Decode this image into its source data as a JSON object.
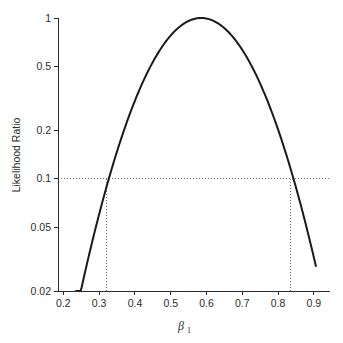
{
  "chart_data": {
    "type": "line",
    "title": "",
    "xlabel": "β₁",
    "ylabel": "Likelihood Ratio",
    "xlabel_base": "β",
    "xlabel_sub": "1",
    "yscale": "log",
    "xscale": "linear",
    "xlim": [
      0.185,
      0.945
    ],
    "ylim": [
      0.02,
      1.0
    ],
    "grid": false,
    "legend": null,
    "xticks": [
      0.2,
      0.3,
      0.4,
      0.5,
      0.6,
      0.7,
      0.8,
      0.9
    ],
    "xtick_labels": [
      "0.2",
      "0.3",
      "0.4",
      "0.5",
      "0.6",
      "0.7",
      "0.8",
      "0.9"
    ],
    "yticks": [
      1,
      0.5,
      0.2,
      0.1,
      0.05,
      0.02
    ],
    "ytick_labels": [
      "1",
      "0.5",
      "0.2",
      "0.1",
      "0.05",
      "0.02"
    ],
    "curve_peak_x": 0.585,
    "curve_peak_y": 1.0,
    "curve_x_start": 0.2355,
    "curve_x_end": 0.9055,
    "quadratic_coefficient": -34.6,
    "series": [
      {
        "name": "Likelihood Ratio",
        "x": [
          0.2355,
          0.25,
          0.27,
          0.29,
          0.31,
          0.32,
          0.33,
          0.35,
          0.37,
          0.39,
          0.41,
          0.43,
          0.45,
          0.47,
          0.49,
          0.51,
          0.53,
          0.55,
          0.57,
          0.585,
          0.6,
          0.62,
          0.64,
          0.66,
          0.68,
          0.7,
          0.72,
          0.74,
          0.76,
          0.78,
          0.8,
          0.82,
          0.835,
          0.85,
          0.87,
          0.89,
          0.9055
        ],
        "y": [
          0.02,
          0.0277,
          0.0427,
          0.0638,
          0.0925,
          0.11,
          0.13,
          0.179,
          0.24,
          0.313,
          0.397,
          0.49,
          0.587,
          0.683,
          0.772,
          0.849,
          0.91,
          0.953,
          0.98,
          1.0,
          0.991,
          0.962,
          0.91,
          0.84,
          0.756,
          0.662,
          0.565,
          0.47,
          0.38,
          0.3,
          0.231,
          0.173,
          0.143,
          0.114,
          0.08,
          0.055,
          0.02
        ]
      }
    ],
    "reference_lines": [
      {
        "name": "likelihood-ratio-threshold",
        "orientation": "horizontal",
        "value": 0.1,
        "style": "dotted"
      },
      {
        "name": "lower-confidence-bound",
        "orientation": "vertical",
        "value": 0.32,
        "from": 0.02,
        "to": 0.1,
        "style": "dotted"
      },
      {
        "name": "upper-confidence-bound",
        "orientation": "vertical",
        "value": 0.835,
        "from": 0.02,
        "to": 0.1,
        "style": "dotted"
      }
    ],
    "colors": {
      "curve": "#1a1a1a",
      "axis": "#2b2b2b",
      "reference": "#6e6e6e",
      "background": "#ffffff"
    }
  }
}
